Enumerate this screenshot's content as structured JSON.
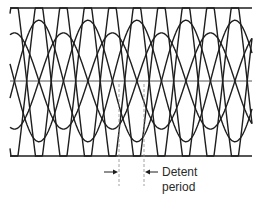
{
  "diagram": {
    "type": "waveform-overlay",
    "colors": {
      "stroke": "#1e1e1e",
      "axis": "#555555",
      "dashed": "#8a8a8a",
      "background": "#ffffff"
    },
    "geometry": {
      "x_start": 10,
      "x_end": 252,
      "top_y": 8,
      "bottom_y": 156,
      "center_y": 81,
      "period": 98,
      "detent_period_px": 25,
      "dashed_lines_x": [
        119,
        144
      ]
    },
    "annotation": {
      "line1": "Detent",
      "line2": "period"
    }
  }
}
